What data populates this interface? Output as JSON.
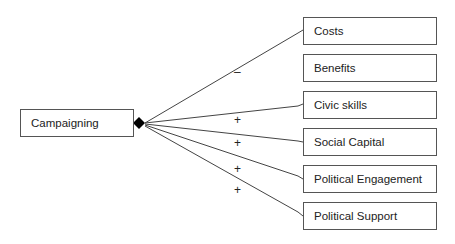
{
  "source": {
    "label": "Campaigning"
  },
  "targets": [
    {
      "label": "Costs",
      "sign": "–"
    },
    {
      "label": "Benefits",
      "sign": ""
    },
    {
      "label": "Civic skills",
      "sign": "+"
    },
    {
      "label": "Social Capital",
      "sign": "+"
    },
    {
      "label": "Political Engagement",
      "sign": "+"
    },
    {
      "label": "Political Support",
      "sign": "+"
    }
  ],
  "colors": {
    "line": "#444444",
    "border": "#555555",
    "diamond": "#000000"
  }
}
